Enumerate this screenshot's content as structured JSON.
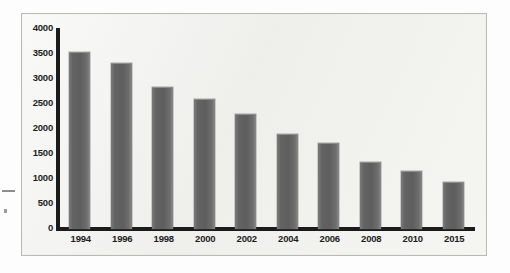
{
  "chart_data": {
    "type": "bar",
    "title": "",
    "subtitle": "",
    "xlabel": "",
    "ylabel": "",
    "categories": [
      "1994",
      "1996",
      "1998",
      "2000",
      "2002",
      "2004",
      "2006",
      "2008",
      "2010",
      "2015"
    ],
    "values": [
      3500,
      3280,
      2800,
      2560,
      2260,
      1880,
      1700,
      1320,
      1140,
      920
    ],
    "series": [
      {
        "name": "",
        "values": [
          3500,
          3280,
          2800,
          2560,
          2260,
          1880,
          1700,
          1320,
          1140,
          920
        ]
      }
    ],
    "ylim": [
      0,
      4000
    ],
    "y_ticks": [
      0,
      500,
      1000,
      1500,
      2000,
      2500,
      3000,
      3500,
      4000
    ],
    "y_tick_labels": [
      "0",
      "500",
      "1000",
      "1500",
      "2000",
      "2500",
      "3000",
      "3500",
      "4000"
    ],
    "x_tick_labels": [
      "1994",
      "1996",
      "1998",
      "2000",
      "2002",
      "2004",
      "2006",
      "2008",
      "2010",
      "2015"
    ],
    "grid": false,
    "legend": false,
    "legend_position": "none",
    "annotations": [],
    "bar_color": "#636363",
    "axis_color": "#1b1b1b",
    "plot_background": "#f2f2f0"
  },
  "figure": {
    "border_color": "#b9b9b6",
    "page_background": "#fdfdfd"
  }
}
